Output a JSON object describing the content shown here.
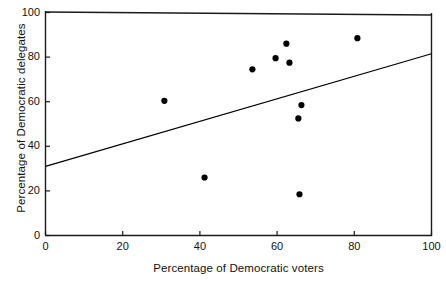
{
  "chart_data": {
    "type": "scatter",
    "title": "",
    "xlabel": "Percentage of Democratic voters",
    "ylabel": "Percentage of Democratic delegates",
    "xlim": [
      0,
      100
    ],
    "ylim": [
      0,
      100
    ],
    "xticks": [
      0,
      20,
      40,
      60,
      80,
      100
    ],
    "yticks": [
      0,
      20,
      40,
      60,
      80,
      100
    ],
    "xtick_labels": [
      "0",
      "20",
      "40",
      "60",
      "80",
      "100"
    ],
    "ytick_labels": [
      "0",
      "20",
      "40",
      "60",
      "80",
      "100"
    ],
    "grid": false,
    "legend": null,
    "series": [
      {
        "name": "states",
        "marker": "filled-circle",
        "color": "#000000",
        "points": [
          {
            "x": 30.8,
            "y": 60.4
          },
          {
            "x": 41.2,
            "y": 26.0
          },
          {
            "x": 53.6,
            "y": 74.5
          },
          {
            "x": 59.6,
            "y": 79.5
          },
          {
            "x": 62.4,
            "y": 86.0
          },
          {
            "x": 63.2,
            "y": 77.5
          },
          {
            "x": 65.5,
            "y": 52.5
          },
          {
            "x": 65.8,
            "y": 18.5
          },
          {
            "x": 66.3,
            "y": 58.5
          },
          {
            "x": 80.8,
            "y": 88.5
          }
        ]
      }
    ],
    "trendline": {
      "name": "least-squares fit",
      "color": "#000000",
      "x_start": 0,
      "y_start": 31.0,
      "x_end": 100,
      "y_end": 81.5
    }
  },
  "axes": {
    "x_label": "Percentage of Democratic voters",
    "y_label": "Percentage of Democratic delegates",
    "x_ticks": [
      "0",
      "20",
      "40",
      "60",
      "80",
      "100"
    ],
    "y_ticks": [
      "0",
      "20",
      "40",
      "60",
      "80",
      "100"
    ]
  },
  "style": {
    "line_color": "#1a1a1a",
    "marker_color": "#000000",
    "background": "#ffffff"
  }
}
